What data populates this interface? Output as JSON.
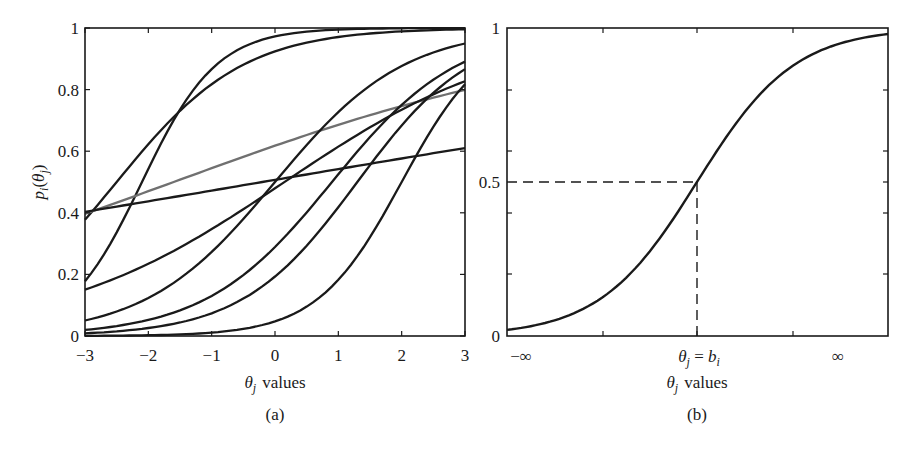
{
  "figure": {
    "panel_a": {
      "caption": "(a)",
      "xlabel_symbol": "θ",
      "xlabel_sub": "j",
      "xlabel_text": "values",
      "ylabel_p": "p",
      "ylabel_i": "i",
      "ylabel_theta": "θ",
      "ylabel_j": "j"
    },
    "panel_b": {
      "caption": "(b)",
      "xlabel_symbol": "θ",
      "xlabel_sub": "j",
      "xlabel_text": "values",
      "tick_left": "−∞",
      "tick_right": "∞",
      "tick_mid_theta": "θ",
      "tick_mid_j": "j",
      "tick_mid_eq": " = ",
      "tick_mid_b": "b",
      "tick_mid_i": "i"
    }
  },
  "chart_data": [
    {
      "type": "line",
      "title": "(a)",
      "xlabel": "θj values",
      "ylabel": "pi(θj)",
      "xlim": [
        -3,
        3
      ],
      "ylim": [
        0,
        1
      ],
      "xticks": [
        "−3",
        "−2",
        "−1",
        "0",
        "1",
        "2",
        "3"
      ],
      "yticks": [
        "0",
        "0.2",
        "0.4",
        "0.6",
        "0.8",
        "1"
      ],
      "grid": false,
      "x": [
        -3,
        -2.5,
        -2,
        -1.5,
        -1,
        -0.5,
        0,
        0.5,
        1,
        1.5,
        2,
        2.5,
        3
      ],
      "series": [
        {
          "name": "item-1",
          "color": "#1a1a1a",
          "a": 1.0,
          "b": -2.5,
          "values": [
            0.38,
            0.5,
            0.62,
            0.73,
            0.82,
            0.88,
            0.92,
            0.95,
            0.97,
            0.98,
            0.99,
            0.99,
            1.0
          ]
        },
        {
          "name": "item-2",
          "color": "#1a1a1a",
          "a": 1.7,
          "b": -2.1,
          "values": [
            0.18,
            0.32,
            0.54,
            0.74,
            0.87,
            0.94,
            0.97,
            0.99,
            0.99,
            1.0,
            1.0,
            1.0,
            1.0
          ]
        },
        {
          "name": "item-3",
          "color": "#707070",
          "a": 0.3,
          "b": -1.6,
          "values": [
            0.4,
            0.43,
            0.47,
            0.51,
            0.54,
            0.58,
            0.62,
            0.65,
            0.68,
            0.71,
            0.74,
            0.77,
            0.8
          ]
        },
        {
          "name": "item-4",
          "color": "#1a1a1a",
          "a": 0.14,
          "b": -0.2,
          "values": [
            0.4,
            0.42,
            0.43,
            0.45,
            0.47,
            0.48,
            0.5,
            0.52,
            0.54,
            0.56,
            0.57,
            0.59,
            0.61
          ]
        },
        {
          "name": "item-5",
          "color": "#1a1a1a",
          "a": 0.55,
          "b": 0.15,
          "values": [
            0.15,
            0.19,
            0.24,
            0.3,
            0.37,
            0.44,
            0.52,
            0.59,
            0.66,
            0.72,
            0.77,
            0.8,
            0.83
          ]
        },
        {
          "name": "item-6",
          "color": "#1a1a1a",
          "a": 0.98,
          "b": 0.0,
          "values": [
            0.05,
            0.08,
            0.12,
            0.19,
            0.27,
            0.38,
            0.5,
            0.62,
            0.73,
            0.81,
            0.88,
            0.92,
            0.95
          ]
        },
        {
          "name": "item-7",
          "color": "#1a1a1a",
          "a": 1.0,
          "b": 0.9,
          "values": [
            0.02,
            0.03,
            0.05,
            0.08,
            0.13,
            0.2,
            0.29,
            0.4,
            0.52,
            0.65,
            0.75,
            0.83,
            0.89
          ]
        },
        {
          "name": "item-8",
          "color": "#1a1a1a",
          "a": 1.1,
          "b": 1.3,
          "values": [
            0.01,
            0.015,
            0.03,
            0.04,
            0.07,
            0.12,
            0.19,
            0.29,
            0.42,
            0.56,
            0.68,
            0.79,
            0.87
          ]
        },
        {
          "name": "item-9",
          "color": "#1a1a1a",
          "a": 1.5,
          "b": 2.0,
          "values": [
            0.0,
            0.001,
            0.002,
            0.005,
            0.01,
            0.02,
            0.05,
            0.1,
            0.18,
            0.32,
            0.5,
            0.68,
            0.82
          ]
        }
      ]
    },
    {
      "type": "line",
      "title": "(b)",
      "xlabel": "θj values",
      "ylabel": "",
      "xlim": [
        "−∞",
        "∞"
      ],
      "ylim": [
        0,
        1
      ],
      "xticks": [
        "−∞",
        "θj = bi",
        "∞"
      ],
      "yticks": [
        "0",
        "0.5",
        "1"
      ],
      "grid": false,
      "annotations": [
        {
          "type": "dashed-hline",
          "y": 0.5,
          "from_x": "−∞",
          "to_x": "θj = bi"
        },
        {
          "type": "dashed-vline",
          "x": "θj = bi",
          "from_y": 0,
          "to_y": 0.5
        }
      ],
      "series": [
        {
          "name": "icc",
          "color": "#1a1a1a",
          "description": "logistic curve centered at bi",
          "values_at": {
            "left_edge": 0.02,
            "bi": 0.5,
            "right_edge": 0.98
          }
        }
      ]
    }
  ]
}
